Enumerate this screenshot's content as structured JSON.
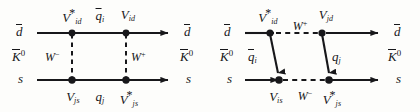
{
  "figure": {
    "kind": "feynman-box-diagrams",
    "background_color": "#fdfdfb",
    "line_color": "#17171a"
  },
  "diagrams": [
    {
      "id": "left",
      "name": "box-diagram-vertical-w",
      "external": {
        "in_top": "d",
        "in_top_bar": true,
        "in_bottom": "s",
        "out_top": "d",
        "out_top_bar": true,
        "out_bottom": "s",
        "meson_in": "K",
        "meson_in_charge": "0",
        "meson_out": "K",
        "meson_out_charge": "0"
      },
      "vertices": {
        "top_left": {
          "symbol": "V",
          "sub": "id",
          "star": true
        },
        "top_right": {
          "symbol": "V",
          "sub": "id",
          "star": false
        },
        "bottom_left": {
          "symbol": "V",
          "sub": "js",
          "star": false
        },
        "bottom_right": {
          "symbol": "V",
          "sub": "js",
          "star": true
        }
      },
      "internal": {
        "top_quark": {
          "symbol": "q",
          "sub": "i",
          "bar": true
        },
        "bottom_quark": {
          "symbol": "q",
          "sub": "j",
          "bar": false
        },
        "left_boson": {
          "symbol": "W",
          "charge": "−",
          "orientation": "vertical",
          "style": "dashed"
        },
        "right_boson": {
          "symbol": "W",
          "charge": "+",
          "orientation": "vertical",
          "style": "dashed"
        }
      }
    },
    {
      "id": "right",
      "name": "box-diagram-horizontal-w",
      "external": {
        "in_top": "d",
        "in_top_bar": true,
        "in_bottom": "s",
        "out_top": "d",
        "out_top_bar": true,
        "out_bottom": "s",
        "meson_in": "K",
        "meson_in_charge": "0",
        "meson_out": "K",
        "meson_out_charge": "0"
      },
      "vertices": {
        "top_left": {
          "symbol": "V",
          "sub": "id",
          "star": true
        },
        "top_right": {
          "symbol": "V",
          "sub": "jd",
          "star": false
        },
        "bottom_left": {
          "symbol": "V",
          "sub": "is",
          "star": false
        },
        "bottom_right": {
          "symbol": "V",
          "sub": "js",
          "star": true
        }
      },
      "internal": {
        "left_quark": {
          "symbol": "q",
          "sub": "i",
          "bar": true
        },
        "right_quark": {
          "symbol": "q",
          "sub": "j",
          "bar": false
        },
        "top_boson": {
          "symbol": "W",
          "charge": "+",
          "orientation": "horizontal",
          "style": "dashed"
        },
        "bottom_boson": {
          "symbol": "W",
          "charge": "−",
          "orientation": "horizontal",
          "style": "dashed"
        }
      }
    }
  ],
  "glyphs": {
    "d": "d",
    "s": "s",
    "q": "q",
    "V": "V",
    "W": "W",
    "K": "K",
    "star": "*",
    "charge_zero": "0",
    "charge_plus": "+",
    "charge_minus": "−"
  }
}
